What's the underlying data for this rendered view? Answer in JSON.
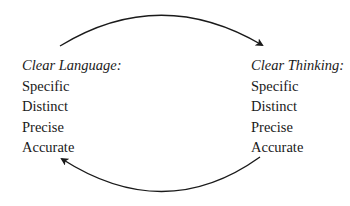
{
  "left": {
    "heading": "Clear Language:",
    "items": [
      "Specific",
      "Distinct",
      "Precise",
      "Accurate"
    ]
  },
  "right": {
    "heading": "Clear Thinking:",
    "items": [
      "Specific",
      "Distinct",
      "Precise",
      "Accurate"
    ]
  },
  "arrows": [
    {
      "from": "Clear Language",
      "to": "Clear Thinking",
      "position": "top"
    },
    {
      "from": "Clear Thinking",
      "to": "Clear Language",
      "position": "bottom"
    }
  ]
}
